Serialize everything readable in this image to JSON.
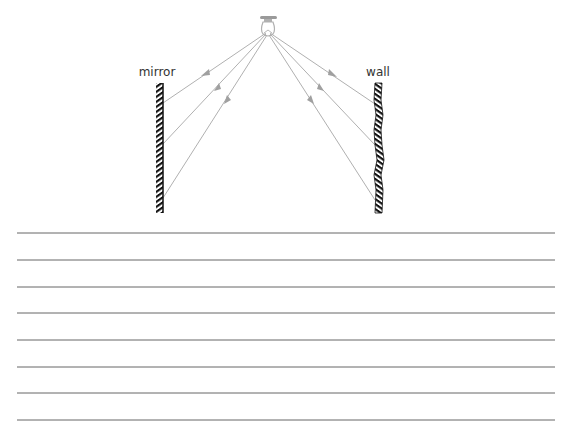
{
  "diagram": {
    "labels": {
      "mirror": "mirror",
      "wall": "wall"
    },
    "colors": {
      "ray": "#a8a8a8",
      "arrow": "#a0a0a0",
      "hatch": "#111111",
      "rule_line": "#555555",
      "bulb": "#9a9a9a"
    },
    "light_source": {
      "x": 268,
      "y": 34
    },
    "rays_to_mirror": [
      {
        "hit_y": 103
      },
      {
        "hit_y": 144
      },
      {
        "hit_y": 198
      }
    ],
    "rays_to_wall": [
      {
        "hit_y": 104
      },
      {
        "hit_y": 145
      },
      {
        "hit_y": 200
      }
    ]
  },
  "writing_lines": {
    "count": 8,
    "y_positions": [
      233,
      260,
      287,
      313,
      340,
      367,
      393,
      420
    ]
  }
}
